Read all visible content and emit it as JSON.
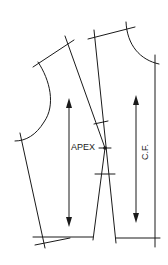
{
  "diagram": {
    "type": "bodice-front-pattern",
    "labels": {
      "apex": "APEX",
      "center_front": "C.F."
    },
    "colors": {
      "line": "#1a1a1a",
      "background": "#ffffff"
    },
    "elements": [
      "left-armhole-curve",
      "left-shoulder-line",
      "left-side-seam",
      "dart-left-leg",
      "dart-right-leg",
      "right-shoulder-line",
      "neckline-curve",
      "center-front-line",
      "waist-hem-lines",
      "grainline-arrow-left",
      "grainline-arrow-right",
      "apex-point"
    ]
  }
}
